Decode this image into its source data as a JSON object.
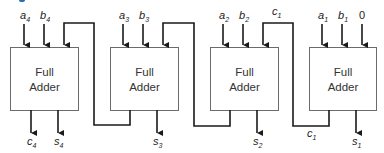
{
  "diagram": {
    "title": "",
    "block_label_line1": "Full",
    "block_label_line2": "Adder",
    "colors": {
      "stroke": "#1a1a1a",
      "box_stroke": "#6b6b6b",
      "accent_fragment": "#2a6db5"
    },
    "adders": [
      {
        "id": "fa4",
        "inputs": [
          {
            "name": "a",
            "sub": "4"
          },
          {
            "name": "b",
            "sub": "4"
          }
        ],
        "outputs": [
          {
            "name": "c",
            "sub": "4"
          },
          {
            "name": "s",
            "sub": "4"
          }
        ]
      },
      {
        "id": "fa3",
        "inputs": [
          {
            "name": "a",
            "sub": "3"
          },
          {
            "name": "b",
            "sub": "3"
          }
        ],
        "outputs": [
          {
            "name": "s",
            "sub": "3"
          }
        ]
      },
      {
        "id": "fa2",
        "inputs": [
          {
            "name": "a",
            "sub": "2"
          },
          {
            "name": "b",
            "sub": "2"
          },
          {
            "name": "c",
            "sub": "1"
          }
        ],
        "outputs": [
          {
            "name": "s",
            "sub": "2"
          }
        ]
      },
      {
        "id": "fa1",
        "inputs": [
          {
            "name": "a",
            "sub": "1"
          },
          {
            "name": "b",
            "sub": "1"
          },
          {
            "name": "0",
            "sub": ""
          }
        ],
        "outputs": [
          {
            "name": "c",
            "sub": "1"
          },
          {
            "name": "s",
            "sub": "1"
          }
        ]
      }
    ],
    "labels": {
      "a4": "a",
      "a4_sub": "4",
      "b4": "b",
      "b4_sub": "4",
      "a3": "a",
      "a3_sub": "3",
      "b3": "b",
      "b3_sub": "3",
      "a2": "a",
      "a2_sub": "2",
      "b2": "b",
      "b2_sub": "2",
      "c1_top": "c",
      "c1_top_sub": "1",
      "a1": "a",
      "a1_sub": "1",
      "b1": "b",
      "b1_sub": "1",
      "zero": "0",
      "c4": "c",
      "c4_sub": "4",
      "s4": "s",
      "s4_sub": "4",
      "s3": "s",
      "s3_sub": "3",
      "s2": "s",
      "s2_sub": "2",
      "c1_bottom": "c",
      "c1_bottom_sub": "1",
      "s1": "s",
      "s1_sub": "1"
    }
  }
}
